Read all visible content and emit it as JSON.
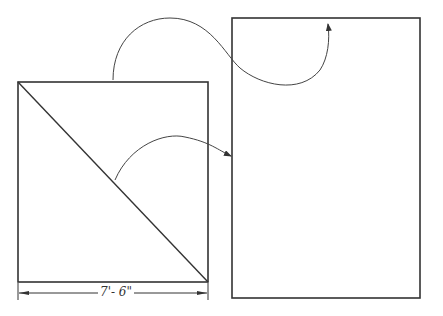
{
  "diagram": {
    "square": {
      "x": 18,
      "y": 82,
      "width": 190,
      "height": 200,
      "diagonal": true
    },
    "rectangle": {
      "x": 232,
      "y": 18,
      "width": 188,
      "height": 280
    },
    "dimension": {
      "label": "7'- 6\""
    },
    "stroke_color": "#333333"
  }
}
